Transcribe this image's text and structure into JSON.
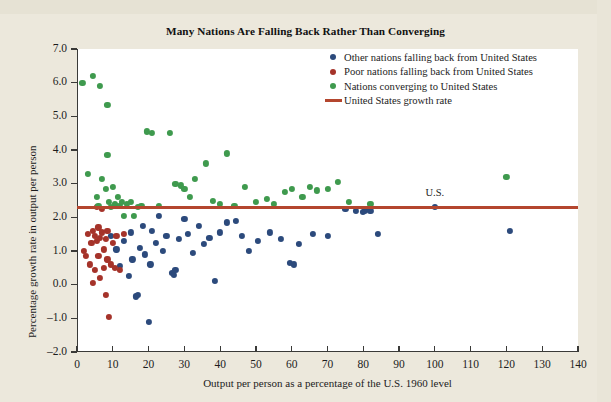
{
  "chart_data": {
    "type": "scatter",
    "title": "Many Nations Are Falling Back Rather Than Converging",
    "xlabel": "Output per person as a percentage of the U.S. 1960 level",
    "ylabel": "Percentage growth rate in output per person",
    "xlim": [
      0,
      140
    ],
    "ylim": [
      -2.0,
      7.0
    ],
    "xticks": [
      0,
      10,
      20,
      30,
      40,
      50,
      60,
      70,
      80,
      90,
      100,
      110,
      120,
      130,
      140
    ],
    "yticks": [
      "-2.0",
      "-1.0",
      "0.0",
      "1.0",
      "2.0",
      "3.0",
      "4.0",
      "5.0",
      "6.0",
      "7.0"
    ],
    "grid": false,
    "legend_position": "top-right",
    "annotations": [
      {
        "text": "U.S.",
        "x": 100,
        "y": 2.3
      }
    ],
    "reference_line": {
      "label": "United States growth rate",
      "value": 2.3,
      "orientation": "horizontal",
      "color": "#b4462e"
    },
    "series": [
      {
        "name": "Other nations falling back from United States",
        "color": "#2c4a7c",
        "points": [
          [
            9.5,
            1.45
          ],
          [
            11.0,
            1.05
          ],
          [
            12.0,
            0.55
          ],
          [
            13.0,
            1.3
          ],
          [
            14.5,
            0.25
          ],
          [
            15.0,
            1.55
          ],
          [
            15.5,
            0.75
          ],
          [
            16.5,
            -0.35
          ],
          [
            17.0,
            -0.3
          ],
          [
            17.5,
            1.1
          ],
          [
            18.5,
            1.75
          ],
          [
            19.0,
            0.9
          ],
          [
            20.0,
            -1.1
          ],
          [
            20.5,
            0.6
          ],
          [
            21.0,
            1.6
          ],
          [
            22.0,
            1.25
          ],
          [
            23.0,
            2.05
          ],
          [
            24.0,
            1.0
          ],
          [
            25.0,
            1.45
          ],
          [
            26.5,
            0.35
          ],
          [
            27.0,
            0.3
          ],
          [
            27.5,
            0.45
          ],
          [
            28.5,
            1.35
          ],
          [
            30.0,
            1.95
          ],
          [
            31.0,
            1.5
          ],
          [
            32.5,
            0.95
          ],
          [
            34.0,
            1.75
          ],
          [
            35.5,
            1.2
          ],
          [
            37.0,
            1.4
          ],
          [
            38.5,
            0.1
          ],
          [
            40.0,
            1.55
          ],
          [
            42.0,
            1.85
          ],
          [
            44.5,
            1.9
          ],
          [
            46.0,
            1.45
          ],
          [
            48.0,
            1.0
          ],
          [
            50.5,
            1.3
          ],
          [
            54.0,
            1.55
          ],
          [
            57.0,
            1.35
          ],
          [
            59.5,
            0.65
          ],
          [
            60.5,
            0.6
          ],
          [
            62.0,
            1.2
          ],
          [
            66.0,
            1.5
          ],
          [
            70.0,
            1.45
          ],
          [
            75.0,
            2.25
          ],
          [
            78.0,
            2.2
          ],
          [
            80.0,
            2.15
          ],
          [
            80.5,
            2.2
          ],
          [
            81.0,
            2.25
          ],
          [
            82.0,
            2.2
          ],
          [
            84.0,
            1.5
          ],
          [
            100.0,
            2.3
          ],
          [
            121.0,
            1.6
          ]
        ]
      },
      {
        "name": "Poor nations falling back from United States",
        "color": "#a5332a",
        "points": [
          [
            2.0,
            1.0
          ],
          [
            2.5,
            0.85
          ],
          [
            3.0,
            1.5
          ],
          [
            3.5,
            0.6
          ],
          [
            4.0,
            1.25
          ],
          [
            4.5,
            1.6
          ],
          [
            4.5,
            0.05
          ],
          [
            5.0,
            1.45
          ],
          [
            5.0,
            0.45
          ],
          [
            5.5,
            2.3
          ],
          [
            5.5,
            1.3
          ],
          [
            6.0,
            1.7
          ],
          [
            6.0,
            0.85
          ],
          [
            6.5,
            1.4
          ],
          [
            6.5,
            0.2
          ],
          [
            7.0,
            2.25
          ],
          [
            7.0,
            1.55
          ],
          [
            7.5,
            1.05
          ],
          [
            7.5,
            0.5
          ],
          [
            8.0,
            1.35
          ],
          [
            8.0,
            -0.3
          ],
          [
            8.5,
            1.6
          ],
          [
            8.5,
            0.75
          ],
          [
            9.0,
            -0.95
          ],
          [
            9.5,
            0.6
          ],
          [
            10.0,
            1.25
          ],
          [
            10.5,
            0.5
          ],
          [
            11.0,
            1.45
          ],
          [
            12.0,
            0.45
          ],
          [
            13.0,
            1.5
          ]
        ]
      },
      {
        "name": "Nations converging to United States",
        "color": "#3f9a4e",
        "points": [
          [
            1.5,
            6.0
          ],
          [
            4.5,
            6.2
          ],
          [
            6.5,
            5.9
          ],
          [
            8.5,
            5.35
          ],
          [
            3.0,
            3.3
          ],
          [
            5.5,
            2.6
          ],
          [
            6.0,
            2.35
          ],
          [
            7.0,
            3.15
          ],
          [
            8.0,
            2.85
          ],
          [
            8.5,
            3.85
          ],
          [
            9.0,
            2.45
          ],
          [
            9.5,
            2.3
          ],
          [
            10.0,
            2.9
          ],
          [
            10.5,
            2.4
          ],
          [
            11.0,
            2.35
          ],
          [
            11.5,
            2.6
          ],
          [
            12.0,
            2.35
          ],
          [
            12.5,
            2.45
          ],
          [
            13.0,
            2.05
          ],
          [
            14.0,
            2.4
          ],
          [
            15.0,
            2.45
          ],
          [
            16.0,
            2.05
          ],
          [
            17.0,
            2.3
          ],
          [
            18.0,
            2.35
          ],
          [
            19.5,
            4.55
          ],
          [
            21.0,
            4.5
          ],
          [
            23.0,
            2.35
          ],
          [
            26.0,
            4.5
          ],
          [
            27.5,
            3.0
          ],
          [
            29.0,
            2.95
          ],
          [
            30.0,
            2.85
          ],
          [
            31.5,
            2.6
          ],
          [
            33.0,
            3.15
          ],
          [
            36.0,
            3.6
          ],
          [
            38.0,
            2.5
          ],
          [
            40.0,
            2.4
          ],
          [
            42.0,
            3.9
          ],
          [
            44.0,
            2.35
          ],
          [
            47.0,
            2.9
          ],
          [
            50.0,
            2.45
          ],
          [
            53.0,
            2.55
          ],
          [
            55.0,
            2.4
          ],
          [
            58.0,
            2.75
          ],
          [
            60.0,
            2.85
          ],
          [
            63.0,
            2.6
          ],
          [
            65.0,
            2.9
          ],
          [
            67.0,
            2.8
          ],
          [
            70.0,
            2.85
          ],
          [
            73.0,
            3.05
          ],
          [
            76.0,
            2.45
          ],
          [
            82.0,
            2.4
          ],
          [
            120.0,
            3.2
          ]
        ]
      }
    ]
  },
  "legend": {
    "items": [
      {
        "label": "Other nations falling back from United States",
        "marker": "dot",
        "color": "#2c4a7c"
      },
      {
        "label": "Poor nations falling back from United States",
        "marker": "dot",
        "color": "#a5332a"
      },
      {
        "label": "Nations converging to United States",
        "marker": "dot",
        "color": "#3f9a4e"
      },
      {
        "label": "United States growth rate",
        "marker": "line",
        "color": "#b4462e"
      }
    ]
  }
}
